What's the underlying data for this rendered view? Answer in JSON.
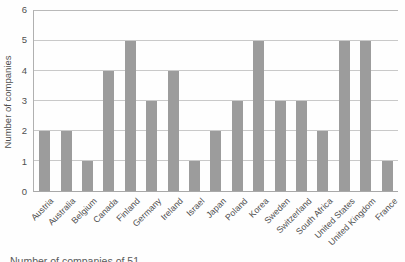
{
  "figure": {
    "caption": "Number of companies of 51"
  },
  "chart_data": {
    "type": "bar",
    "title": "",
    "xlabel": "",
    "ylabel": "Number of companies",
    "categories": [
      "Austria",
      "Australia",
      "Belgium",
      "Canada",
      "Finland",
      "Germany",
      "Ireland",
      "Israel",
      "Japan",
      "Poland",
      "Korea",
      "Sweden",
      "Switzerland",
      "South Africa",
      "United States",
      "United Kingdom",
      "France"
    ],
    "values": [
      2,
      2,
      1,
      4,
      5,
      3,
      4,
      1,
      2,
      3,
      5,
      3,
      3,
      2,
      5,
      5,
      1
    ],
    "ylim": [
      0,
      6
    ],
    "yticks": [
      0,
      1,
      2,
      3,
      4,
      5,
      6
    ],
    "grid": true,
    "legend_position": "none",
    "colors": {
      "bar": "#9c9c9c",
      "gridline": "#c9c9c9",
      "axis": "#a8a8a8",
      "text": "#4f4f4f"
    }
  }
}
